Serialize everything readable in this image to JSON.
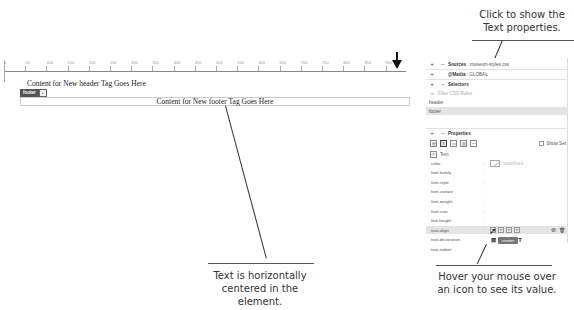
{
  "callouts": {
    "top_right": [
      "Click to show the",
      "Text properties."
    ],
    "bottom_center": [
      "Text is horizontally",
      "centered in the element."
    ],
    "bottom_right": [
      "Hover your mouse over",
      "an icon to see its value."
    ]
  },
  "design_view": {
    "ruler_labels": [
      "0",
      "50",
      "100",
      "150",
      "200",
      "250",
      "300",
      "350",
      "400",
      "450",
      "500",
      "550",
      "600",
      "650",
      "700",
      "750",
      "800",
      "850",
      "900"
    ],
    "header_text": "Content for New header Tag Goes Here",
    "footer_tag_label": "footer",
    "footer_tag_dropdown": "+",
    "footer_text": "Content for New footer Tag Goes Here"
  },
  "css_designer": {
    "sources_label": "Sources",
    "sources_value": "museum-styles.css",
    "media_label": "@Media",
    "media_value": "GLOBAL",
    "selectors_label": "Selectors",
    "filter_placeholder": "Filter CSS Rules",
    "selectors": [
      {
        "name": "header",
        "selected": false
      },
      {
        "name": "footer",
        "selected": true
      }
    ],
    "properties_label": "Properties",
    "show_set_label": "Show Set",
    "category_icons": [
      "layout-icon",
      "text-icon",
      "border-icon",
      "background-icon",
      "more-icon"
    ],
    "active_category": "Text",
    "section_title": "Text",
    "color_value": "undefined",
    "properties": [
      {
        "name": "color"
      },
      {
        "name": "font-family"
      },
      {
        "name": "font-style"
      },
      {
        "name": "font-variant"
      },
      {
        "name": "font-weight"
      },
      {
        "name": "font-size"
      },
      {
        "name": "line-height"
      },
      {
        "name": "text-align",
        "selected": true
      },
      {
        "name": "text-decoration"
      },
      {
        "name": "text-indent"
      }
    ],
    "tooltip": "center"
  }
}
